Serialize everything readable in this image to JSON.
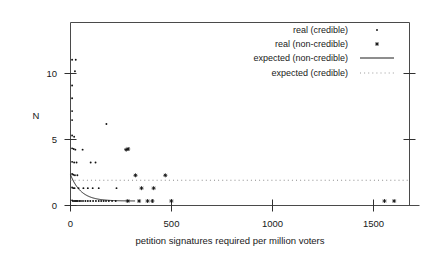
{
  "chart_data": {
    "type": "scatter",
    "title": "",
    "xlabel": "petition signatures required per million voters",
    "ylabel": "N",
    "xlim": [
      0,
      1680
    ],
    "ylim": [
      -0.35,
      13.9
    ],
    "xticks": [
      0,
      500,
      1000,
      1500
    ],
    "xtick_labels": [
      "0",
      "500",
      "1000",
      "1500"
    ],
    "yticks": [
      0,
      5,
      10
    ],
    "ytick_labels": [
      "0",
      "5",
      "10"
    ],
    "grid": false,
    "legend_position": "top-right",
    "legend": [
      {
        "label": "real (credible)",
        "marker": "dot"
      },
      {
        "label": "real (non-credible)",
        "marker": "star"
      },
      {
        "label": "expected (non-credible)",
        "marker": "solid-line"
      },
      {
        "label": "expected (credible)",
        "marker": "dotted-line"
      }
    ],
    "series": [
      {
        "name": "real (credible)",
        "marker": "dot",
        "points": [
          [
            8,
            11.0
          ],
          [
            26,
            11.0
          ],
          [
            22,
            10.1
          ],
          [
            8,
            9.0
          ],
          [
            8,
            8.0
          ],
          [
            8,
            7.0
          ],
          [
            8,
            6.3
          ],
          [
            178,
            6.0
          ],
          [
            8,
            5.1
          ],
          [
            18,
            5.0
          ],
          [
            8,
            4.1
          ],
          [
            16,
            4.05
          ],
          [
            24,
            4.0
          ],
          [
            60,
            4.0
          ],
          [
            8,
            3.05
          ],
          [
            18,
            3.0
          ],
          [
            30,
            3.0
          ],
          [
            100,
            3.0
          ],
          [
            124,
            3.0
          ],
          [
            8,
            2.1
          ],
          [
            14,
            2.05
          ],
          [
            22,
            2.0
          ],
          [
            34,
            2.0
          ],
          [
            8,
            1.05
          ],
          [
            14,
            1.0
          ],
          [
            20,
            1.0
          ],
          [
            40,
            1.0
          ],
          [
            64,
            1.0
          ],
          [
            86,
            1.0
          ],
          [
            110,
            1.0
          ],
          [
            140,
            1.0
          ],
          [
            228,
            1.0
          ],
          [
            8,
            0.05
          ],
          [
            12,
            0.0
          ],
          [
            18,
            0.0
          ],
          [
            24,
            0.0
          ],
          [
            30,
            0.0
          ],
          [
            36,
            0.0
          ],
          [
            44,
            0.0
          ],
          [
            52,
            0.0
          ],
          [
            62,
            0.0
          ],
          [
            74,
            0.0
          ],
          [
            86,
            0.0
          ],
          [
            98,
            0.0
          ],
          [
            112,
            0.0
          ],
          [
            126,
            0.0
          ],
          [
            140,
            0.0
          ],
          [
            152,
            0.0
          ],
          [
            164,
            0.0
          ],
          [
            176,
            0.0
          ],
          [
            190,
            0.0
          ],
          [
            206,
            0.0
          ],
          [
            224,
            0.0
          ]
        ]
      },
      {
        "name": "real (non-credible)",
        "marker": "star",
        "points": [
          [
            276,
            4.0
          ],
          [
            286,
            4.05
          ],
          [
            322,
            2.0
          ],
          [
            470,
            2.0
          ],
          [
            352,
            1.0
          ],
          [
            412,
            1.0
          ],
          [
            284,
            0.0
          ],
          [
            340,
            0.0
          ],
          [
            382,
            0.0
          ],
          [
            406,
            0.0
          ],
          [
            500,
            0.0
          ],
          [
            1556,
            0.0
          ],
          [
            1604,
            0.0
          ]
        ]
      }
    ],
    "fits": [
      {
        "name": "expected (non-credible)",
        "style": "solid",
        "formula": "exponential decay",
        "amplitude": 2.05,
        "decay_scale": 52,
        "x_range": [
          0,
          320
        ]
      },
      {
        "name": "expected (credible)",
        "style": "dotted",
        "formula": "constant",
        "level": 1.62,
        "x_range": [
          0,
          1680
        ]
      }
    ]
  }
}
